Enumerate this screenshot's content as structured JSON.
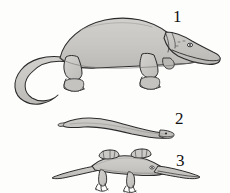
{
  "figure": {
    "background_color": "#fdfdfc",
    "body_fill_color": "#c9c7c4",
    "body_shade_color": "#b3b1ae",
    "outline_color": "#2b2b2b",
    "label_color": "#111111",
    "style": "pen-and-ink line drawing with flat grey wash",
    "width": 230,
    "height": 193
  },
  "labels": [
    {
      "id": "1",
      "text": "1",
      "subject": "large-quadruped-tetrapod",
      "position": "upper-right"
    },
    {
      "id": "2",
      "text": "2",
      "subject": "elongate-eel-like-amphibian",
      "position": "middle-right"
    },
    {
      "id": "3",
      "text": "3",
      "subject": "flat-bodied-long-snouted-tetrapod",
      "position": "lower-right"
    }
  ],
  "subjects": [
    {
      "number": "1",
      "name": "large-quadruped-tetrapod",
      "description": "Large robust salamander-like tetrapod in left profile, head at right, broad arched back, long tapering tail curving to lower left, two visible limbs with splayed clawed feet",
      "orientation": "facing-right",
      "features": [
        "arched back",
        "broad snout",
        "eye",
        "jaw line",
        "curved tail",
        "four-toed feet"
      ]
    },
    {
      "number": "2",
      "name": "elongate-eel-like-amphibian",
      "description": "Very slender elongate limbless aistopod-like amphibian in left profile, small pointed head at right, sinuous ribbon-shaped body",
      "orientation": "facing-right",
      "features": [
        "sinuous body",
        "no limbs",
        "small head",
        "pointed tail"
      ]
    },
    {
      "number": "3",
      "name": "flat-bodied-long-snouted-tetrapod",
      "description": "Flattened broad-bodied tetrapod in left profile with very long narrow snout, prominent tabular horns at rear of skull, splayed limbs and long tapering tail",
      "orientation": "facing-right",
      "features": [
        "long narrow snout",
        "tabular horns",
        "flat body",
        "splayed limbs",
        "tapering tail"
      ]
    }
  ]
}
